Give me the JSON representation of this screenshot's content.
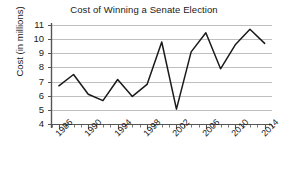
{
  "chart_data": {
    "type": "line",
    "title": "Cost of Winning a Senate Election",
    "xlabel": "",
    "ylabel": "Cost (in millions)",
    "x": [
      1986,
      1988,
      1990,
      1992,
      1994,
      1996,
      1998,
      2000,
      2002,
      2004,
      2006,
      2008,
      2010,
      2012,
      2014
    ],
    "values": [
      6.7,
      7.5,
      6.1,
      5.65,
      7.15,
      5.95,
      6.8,
      9.8,
      5.05,
      9.1,
      10.45,
      7.9,
      9.6,
      10.7,
      9.7
    ],
    "series": [
      {
        "name": "Cost of Winning a Senate Election",
        "values": [
          6.7,
          7.5,
          6.1,
          5.65,
          7.15,
          5.95,
          6.8,
          9.8,
          5.05,
          9.1,
          10.45,
          7.9,
          9.6,
          10.7,
          9.7
        ]
      }
    ],
    "xlim": [
      1985,
      2015
    ],
    "ylim": [
      4,
      11
    ],
    "y_ticks": [
      4,
      5,
      6,
      7,
      8,
      9,
      10,
      11
    ],
    "y_tick_labels": [
      "4",
      "5",
      "6",
      "7",
      "8",
      "9",
      "10",
      "11"
    ],
    "x_ticks": [
      1986,
      1990,
      1994,
      1998,
      2002,
      2006,
      2010,
      2014
    ],
    "x_tick_labels": [
      "1986",
      "1990",
      "1994",
      "1998",
      "2002",
      "2006",
      "2010",
      "2014"
    ],
    "x_minor_tick_step": 1,
    "grid": "horizontal",
    "grid_color": "#b8b8b8",
    "line_color": "#1a1a1a",
    "legend": "none",
    "markers": "none"
  }
}
